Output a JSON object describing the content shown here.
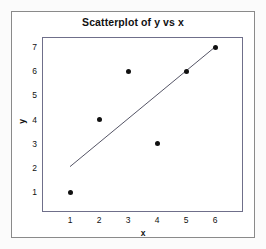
{
  "chart_data": {
    "type": "scatter",
    "title": "Scatterplot of y vs x",
    "xlabel": "x",
    "ylabel": "y",
    "x": [
      1,
      2,
      3,
      4,
      5,
      6
    ],
    "values": [
      1,
      4,
      6,
      3,
      6,
      7
    ],
    "points": [
      {
        "x": 1,
        "y": 1
      },
      {
        "x": 2,
        "y": 4
      },
      {
        "x": 3,
        "y": 6
      },
      {
        "x": 4,
        "y": 3
      },
      {
        "x": 5,
        "y": 6
      },
      {
        "x": 6,
        "y": 7
      }
    ],
    "xticks": [
      1,
      2,
      3,
      4,
      5,
      6
    ],
    "yticks": [
      1,
      2,
      3,
      4,
      5,
      6,
      7
    ],
    "xlim": [
      0.5,
      6.6
    ],
    "ylim": [
      0.55,
      7.4
    ],
    "grid": false,
    "legend": null,
    "trendline": {
      "type": "line",
      "x0": 1.0,
      "y0": 2.05,
      "x1": 6.0,
      "y1": 7.0
    },
    "marker_color": "#111111",
    "line_color": "#555566",
    "frame_color": "#6f6f8a"
  }
}
